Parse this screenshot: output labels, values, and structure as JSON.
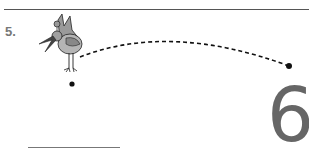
{
  "worksheet": {
    "item_number": "5.",
    "target_digit": "6",
    "illustration": "bird-icon",
    "path": {
      "style": "dashed",
      "start": [
        72,
        84
      ],
      "end": [
        289,
        66
      ]
    },
    "answer_line": ""
  },
  "colors": {
    "rule": "#555555",
    "number": "#777777",
    "digit": "#666666",
    "dash": "#111111"
  }
}
